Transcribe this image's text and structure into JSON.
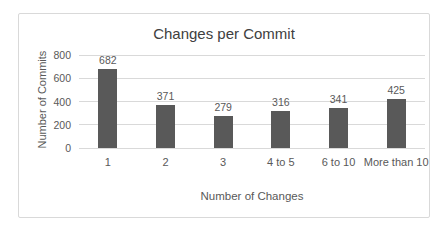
{
  "chart_data": {
    "type": "bar",
    "title": "Changes per Commit",
    "xlabel": "Number of Changes",
    "ylabel": "Number of Commits",
    "categories": [
      "1",
      "2",
      "3",
      "4 to 5",
      "6 to 10",
      "More than 10"
    ],
    "values": [
      682,
      371,
      279,
      316,
      341,
      425
    ],
    "yticks": [
      0,
      200,
      400,
      600,
      800
    ],
    "ylim": [
      0,
      800
    ],
    "grid": true,
    "legend": "none",
    "data_labels_shown": true,
    "colors": {
      "bar": "#595959",
      "gridline": "#D9D9D9",
      "border": "#D9D9D9",
      "text": "#595959",
      "title": "#404040",
      "background": "#FFFFFF"
    }
  }
}
